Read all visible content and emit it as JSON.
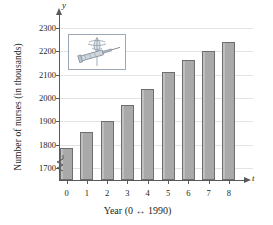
{
  "chart_data": {
    "type": "bar",
    "title": "",
    "xlabel": "Year (0 ↔ 1990)",
    "ylabel": "Number of nurses (in thousands)",
    "x_axis_symbol": "t",
    "y_axis_symbol": "y",
    "categories": [
      "0",
      "1",
      "2",
      "3",
      "4",
      "5",
      "6",
      "7",
      "8"
    ],
    "values": [
      1787,
      1853,
      1904,
      1972,
      2040,
      2112,
      2162,
      2200,
      2237
    ],
    "ylim": [
      1650,
      2350
    ],
    "y_ticks": [
      1700,
      1800,
      1900,
      2000,
      2100,
      2200,
      2300
    ],
    "y_tick_labels": [
      "1700",
      "1800",
      "1900",
      "2000",
      "2100",
      "2200",
      "2300"
    ],
    "grid": true,
    "axis_break": true,
    "legend": "none",
    "bar_color": "#a9a9a9",
    "bar_border_color": "#6d6e70",
    "grid_color": "#e3e3e3",
    "axis_color": "#58595b"
  },
  "inset": {
    "caption": "caduceus-and-syringe-illustration"
  }
}
